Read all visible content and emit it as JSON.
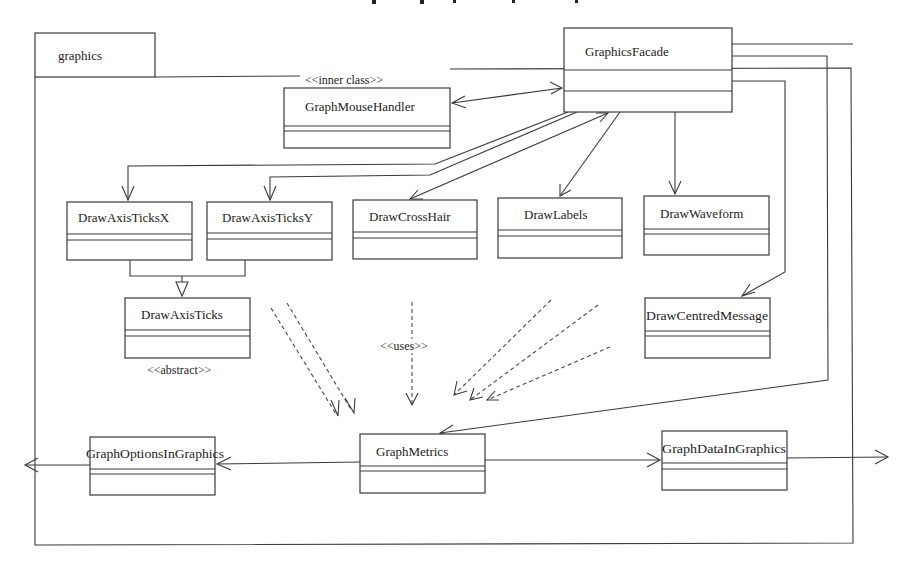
{
  "package": {
    "name": "graphics"
  },
  "classes": {
    "graphics_facade": {
      "name": "GraphicsFacade"
    },
    "graph_mouse_handler": {
      "name": "GraphMouseHandler",
      "stereotype": "<<inner class>>"
    },
    "draw_axis_ticks_x": {
      "name": "DrawAxisTicksX"
    },
    "draw_axis_ticks_y": {
      "name": "DrawAxisTicksY"
    },
    "draw_cross_hair": {
      "name": "DrawCrossHair"
    },
    "draw_labels": {
      "name": "DrawLabels"
    },
    "draw_waveform": {
      "name": "DrawWaveform"
    },
    "draw_centred_message": {
      "name": "DrawCentredMessage"
    },
    "draw_axis_ticks": {
      "name": "DrawAxisTicks",
      "stereotype": "<<abstract>>"
    },
    "graph_metrics": {
      "name": "GraphMetrics"
    },
    "graph_options_in_graphics": {
      "name": "GraphOptionsInGraphics"
    },
    "graph_data_in_graphics": {
      "name": "GraphDataInGraphics"
    }
  },
  "labels": {
    "uses": "<<uses>>"
  },
  "relationships": [
    {
      "from": "GraphicsFacade",
      "to": "GraphMouseHandler",
      "type": "bidirectional-association"
    },
    {
      "from": "GraphicsFacade",
      "to": "DrawAxisTicksX",
      "type": "association"
    },
    {
      "from": "GraphicsFacade",
      "to": "DrawAxisTicksY",
      "type": "association"
    },
    {
      "from": "GraphicsFacade",
      "to": "DrawCrossHair",
      "type": "bidirectional-association"
    },
    {
      "from": "GraphicsFacade",
      "to": "DrawLabels",
      "type": "association"
    },
    {
      "from": "GraphicsFacade",
      "to": "DrawWaveform",
      "type": "association"
    },
    {
      "from": "GraphicsFacade",
      "to": "DrawCentredMessage",
      "type": "association"
    },
    {
      "from": "GraphicsFacade",
      "to": "GraphMetrics",
      "type": "association"
    },
    {
      "from": "GraphicsFacade",
      "to": "external-right",
      "type": "association"
    },
    {
      "from": "DrawAxisTicksX",
      "to": "DrawAxisTicks",
      "type": "generalization"
    },
    {
      "from": "DrawAxisTicksY",
      "to": "DrawAxisTicks",
      "type": "generalization"
    },
    {
      "from": "Draw* classes",
      "to": "GraphMetrics",
      "type": "uses-dependency"
    },
    {
      "from": "GraphMetrics",
      "to": "GraphOptionsInGraphics",
      "type": "association"
    },
    {
      "from": "GraphMetrics",
      "to": "GraphDataInGraphics",
      "type": "association"
    },
    {
      "from": "GraphOptionsInGraphics",
      "to": "external-left",
      "type": "association"
    },
    {
      "from": "GraphDataInGraphics",
      "to": "external-right",
      "type": "association"
    }
  ]
}
